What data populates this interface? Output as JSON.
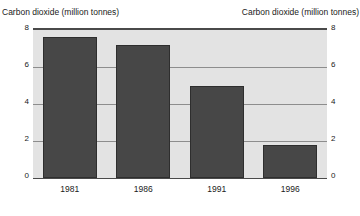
{
  "chart_data": {
    "type": "bar",
    "title": "",
    "categories": [
      "1981",
      "1986",
      "1991",
      "1996"
    ],
    "values": [
      7.6,
      7.2,
      5.0,
      1.8
    ],
    "series": [
      {
        "name": "Carbon dioxide (million tonnes)",
        "values": [
          7.6,
          7.2,
          5.0,
          1.8
        ]
      }
    ],
    "xlabel": "",
    "ylabel": "Carbon dioxide (million tonnes)",
    "y2label": "Carbon dioxide (million tonnes)",
    "ylim": [
      0,
      8
    ],
    "y2lim": [
      0,
      8
    ],
    "yticks": [
      8,
      6,
      4,
      2,
      0
    ],
    "y2ticks": [
      8,
      6,
      4,
      2,
      0
    ],
    "ytick_labels": [
      "8",
      "6",
      "4",
      "2",
      "0"
    ],
    "y2tick_labels": [
      "8",
      "6",
      "4",
      "2",
      "0"
    ],
    "grid": true,
    "grid_axis": "y",
    "legend": false,
    "legend_position": "none",
    "bar_color": "#474747",
    "plot_background": "#e3e3e3",
    "grid_color": "#8d8d8d",
    "frame_color": "#4a4a4a",
    "page_background": "#ffffff",
    "annotations": []
  },
  "axis_titles": {
    "left": "Carbon dioxide (million tonnes)",
    "right": "Carbon dioxide (million tonnes)"
  }
}
